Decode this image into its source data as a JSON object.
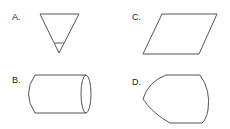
{
  "options": [
    {
      "label": "A.",
      "shape": "inverted-triangle-with-tip-line"
    },
    {
      "label": "B.",
      "shape": "cylinder-horizontal"
    },
    {
      "label": "C.",
      "shape": "parallelogram"
    },
    {
      "label": "D.",
      "shape": "rounded-bullet-shape"
    }
  ],
  "colors": {
    "stroke": "#555555",
    "text": "#222222",
    "background": "#ffffff"
  }
}
